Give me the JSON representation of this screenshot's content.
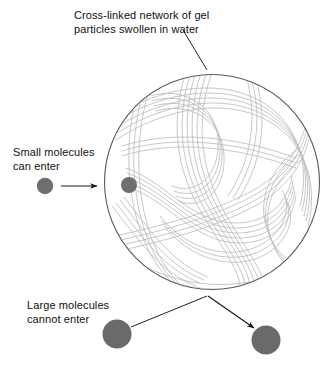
{
  "diagram": {
    "background_color": "#ffffff",
    "labels": {
      "network": {
        "line1": "Cross-linked network of gel",
        "line2": "particles swollen in water"
      },
      "small_molecules": {
        "line1": "Small molecules",
        "line2": "can enter"
      },
      "large_molecules": {
        "line1": "Large molecules",
        "line2": "cannot enter"
      }
    },
    "colors": {
      "text": "#111111",
      "sphere_outline": "#555555",
      "polymer_chain": "#bcbcbc",
      "polymer_chain_dark": "#a9a9a9",
      "molecule_fill": "#6e6e6e",
      "molecule_fill_large": "#6a6a6a",
      "leader_line": "#222222"
    },
    "sphere": {
      "center_x": 212,
      "center_y": 182,
      "radius": 108,
      "label": "gel-particle-sphere"
    },
    "molecules": [
      {
        "name": "small-molecule-outside",
        "size": "small",
        "radius": 8,
        "cx": 45,
        "cy": 186
      },
      {
        "name": "small-molecule-inside",
        "size": "small",
        "radius": 8,
        "cx": 129,
        "cy": 185
      },
      {
        "name": "large-molecule-left",
        "size": "large",
        "radius": 14,
        "cx": 117,
        "cy": 334
      },
      {
        "name": "large-molecule-right",
        "size": "large",
        "radius": 14,
        "cx": 266,
        "cy": 340
      }
    ],
    "arrows": [
      {
        "name": "small-molecule-entry-arrow",
        "from_x": 61,
        "from_y": 186,
        "to_x": 99,
        "to_y": 186,
        "has_head": true
      },
      {
        "name": "large-molecule-rejection-arrow",
        "from_x": 130,
        "from_y": 327,
        "to_x": 256,
        "to_y": 330,
        "has_head": true
      }
    ],
    "leaders": [
      {
        "name": "network-label-leader",
        "from_x": 182,
        "from_y": 30,
        "to_x": 207,
        "to_y": 70
      }
    ]
  }
}
